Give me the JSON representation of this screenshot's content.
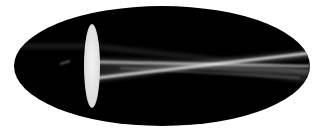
{
  "image": {
    "subject": "Converging lens refracting parallel light rays",
    "description": "Black elliptical backdrop with a white biconvex lens; two parallel horizontal light beams enter from the left, pass through the lens and cross to the right",
    "colors": {
      "background": "#ffffff",
      "backdrop": "#000000",
      "lens": "#e8e8e8",
      "beam": "#f2f2f2",
      "beam_glow": "#777777"
    },
    "elements": [
      {
        "name": "backdrop-ellipse",
        "cx": 162,
        "cy": 66,
        "rx": 148,
        "ry": 60
      },
      {
        "name": "lens",
        "cx": 92,
        "cy": 66,
        "rx": 8,
        "ry": 42
      },
      {
        "name": "beam-upper-incoming",
        "y": 62
      },
      {
        "name": "beam-lower-incoming",
        "y": 78
      }
    ]
  }
}
